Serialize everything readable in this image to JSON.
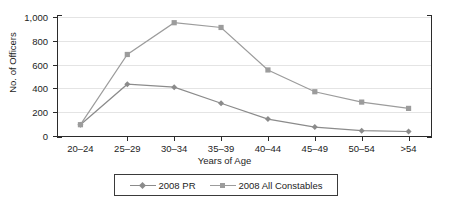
{
  "chart_data": {
    "type": "line",
    "title": "",
    "xlabel": "Years of Age",
    "ylabel": "No. of Officers",
    "categories": [
      "20–24",
      "25–29",
      "30–34",
      "35–39",
      "40–44",
      "45–49",
      "50–54",
      ">54"
    ],
    "ylim": [
      0,
      1000
    ],
    "yticks": [
      0,
      200,
      400,
      600,
      800,
      1000
    ],
    "ytick_labels": [
      "0",
      "200",
      "400",
      "600",
      "800",
      "1,000"
    ],
    "grid": true,
    "legend_position": "bottom-center",
    "series": [
      {
        "name": "2008 PR",
        "marker": "diamond",
        "color": "#8b8b8b",
        "values": [
          95,
          435,
          410,
          275,
          142,
          75,
          45,
          38
        ]
      },
      {
        "name": "2008 All Constables",
        "marker": "square",
        "color": "#9c9c9c",
        "values": [
          95,
          685,
          952,
          912,
          555,
          372,
          285,
          232
        ]
      }
    ]
  },
  "axes": {
    "y_axis_title": "No. of Officers",
    "x_axis_title": "Years of Age"
  },
  "legend": {
    "items": [
      {
        "label": "2008 PR",
        "marker": "diamond",
        "color": "#8b8b8b"
      },
      {
        "label": "2008 All Constables",
        "marker": "square",
        "color": "#9c9c9c"
      }
    ]
  }
}
